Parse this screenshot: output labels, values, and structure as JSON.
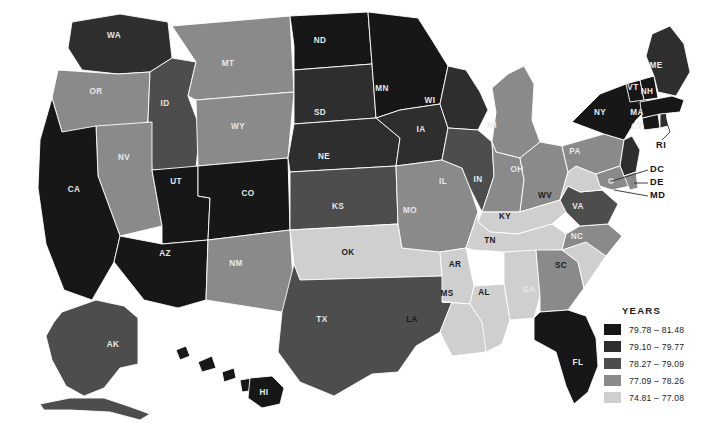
{
  "legend": {
    "title": "YEARS",
    "items": [
      {
        "label": "79.78 – 81.48",
        "color": "#171717",
        "min": 79.78,
        "max": 81.48
      },
      {
        "label": "79.10 – 79.77",
        "color": "#2e2e2e",
        "min": 79.1,
        "max": 79.77
      },
      {
        "label": "78.27 – 79.09",
        "color": "#4d4d4d",
        "min": 78.27,
        "max": 79.09
      },
      {
        "label": "77.09 – 78.26",
        "color": "#8a8a8a",
        "min": 77.09,
        "max": 78.26
      },
      {
        "label": "74.81 – 77.08",
        "color": "#cfcfcf",
        "min": 74.81,
        "max": 77.08
      }
    ]
  },
  "chart_data": {
    "type": "map",
    "unit": "years",
    "legend_title": "YEARS",
    "bins": [
      {
        "label": "79.78 – 81.48",
        "color": "#171717"
      },
      {
        "label": "79.10 – 79.77",
        "color": "#2e2e2e"
      },
      {
        "label": "78.27 – 79.09",
        "color": "#4d4d4d"
      },
      {
        "label": "77.09 – 78.26",
        "color": "#8a8a8a"
      },
      {
        "label": "74.81 – 77.08",
        "color": "#cfcfcf"
      }
    ],
    "states": [
      {
        "code": "WA",
        "bin": 1,
        "color": "#2e2e2e"
      },
      {
        "code": "OR",
        "bin": 3,
        "color": "#8a8a8a"
      },
      {
        "code": "ID",
        "bin": 2,
        "color": "#4d4d4d"
      },
      {
        "code": "MT",
        "bin": 3,
        "color": "#8a8a8a"
      },
      {
        "code": "WY",
        "bin": 3,
        "color": "#8a8a8a"
      },
      {
        "code": "NV",
        "bin": 3,
        "color": "#8a8a8a"
      },
      {
        "code": "CA",
        "bin": 0,
        "color": "#171717"
      },
      {
        "code": "UT",
        "bin": 0,
        "color": "#171717"
      },
      {
        "code": "AZ",
        "bin": 0,
        "color": "#171717"
      },
      {
        "code": "CO",
        "bin": 0,
        "color": "#171717"
      },
      {
        "code": "NM",
        "bin": 3,
        "color": "#8a8a8a"
      },
      {
        "code": "ND",
        "bin": 0,
        "color": "#171717"
      },
      {
        "code": "SD",
        "bin": 1,
        "color": "#2e2e2e"
      },
      {
        "code": "NE",
        "bin": 1,
        "color": "#2e2e2e"
      },
      {
        "code": "KS",
        "bin": 2,
        "color": "#4d4d4d"
      },
      {
        "code": "OK",
        "bin": 4,
        "color": "#cfcfcf"
      },
      {
        "code": "TX",
        "bin": 2,
        "color": "#4d4d4d"
      },
      {
        "code": "MN",
        "bin": 0,
        "color": "#171717"
      },
      {
        "code": "IA",
        "bin": 1,
        "color": "#2e2e2e"
      },
      {
        "code": "MO",
        "bin": 3,
        "color": "#8a8a8a"
      },
      {
        "code": "AR",
        "bin": 4,
        "color": "#cfcfcf"
      },
      {
        "code": "LA",
        "bin": 4,
        "color": "#cfcfcf"
      },
      {
        "code": "WI",
        "bin": 1,
        "color": "#2e2e2e"
      },
      {
        "code": "IL",
        "bin": 2,
        "color": "#4d4d4d"
      },
      {
        "code": "MS",
        "bin": 4,
        "color": "#cfcfcf"
      },
      {
        "code": "MI",
        "bin": 3,
        "color": "#8a8a8a"
      },
      {
        "code": "IN",
        "bin": 3,
        "color": "#8a8a8a"
      },
      {
        "code": "OH",
        "bin": 3,
        "color": "#8a8a8a"
      },
      {
        "code": "KY",
        "bin": 4,
        "color": "#cfcfcf"
      },
      {
        "code": "TN",
        "bin": 4,
        "color": "#cfcfcf"
      },
      {
        "code": "AL",
        "bin": 4,
        "color": "#cfcfcf"
      },
      {
        "code": "GA",
        "bin": 3,
        "color": "#8a8a8a"
      },
      {
        "code": "FL",
        "bin": 0,
        "color": "#171717"
      },
      {
        "code": "SC",
        "bin": 4,
        "color": "#cfcfcf"
      },
      {
        "code": "NC",
        "bin": 3,
        "color": "#8a8a8a"
      },
      {
        "code": "VA",
        "bin": 2,
        "color": "#4d4d4d"
      },
      {
        "code": "WV",
        "bin": 4,
        "color": "#cfcfcf"
      },
      {
        "code": "PA",
        "bin": 3,
        "color": "#8a8a8a"
      },
      {
        "code": "NY",
        "bin": 0,
        "color": "#171717"
      },
      {
        "code": "NJ",
        "bin": 1,
        "color": "#2e2e2e"
      },
      {
        "code": "MD",
        "bin": 3,
        "color": "#8a8a8a"
      },
      {
        "code": "DE",
        "bin": 3,
        "color": "#8a8a8a"
      },
      {
        "code": "DC",
        "bin": 3,
        "color": "#8a8a8a"
      },
      {
        "code": "CT",
        "bin": 0,
        "color": "#171717"
      },
      {
        "code": "RI",
        "bin": 1,
        "color": "#2e2e2e"
      },
      {
        "code": "MA",
        "bin": 0,
        "color": "#171717"
      },
      {
        "code": "VT",
        "bin": 0,
        "color": "#171717"
      },
      {
        "code": "NH",
        "bin": 0,
        "color": "#171717"
      },
      {
        "code": "ME",
        "bin": 1,
        "color": "#2e2e2e"
      },
      {
        "code": "AK",
        "bin": 2,
        "color": "#4d4d4d"
      },
      {
        "code": "HI",
        "bin": 0,
        "color": "#171717"
      }
    ],
    "callouts": [
      "RI",
      "DC",
      "DE",
      "MD"
    ]
  }
}
